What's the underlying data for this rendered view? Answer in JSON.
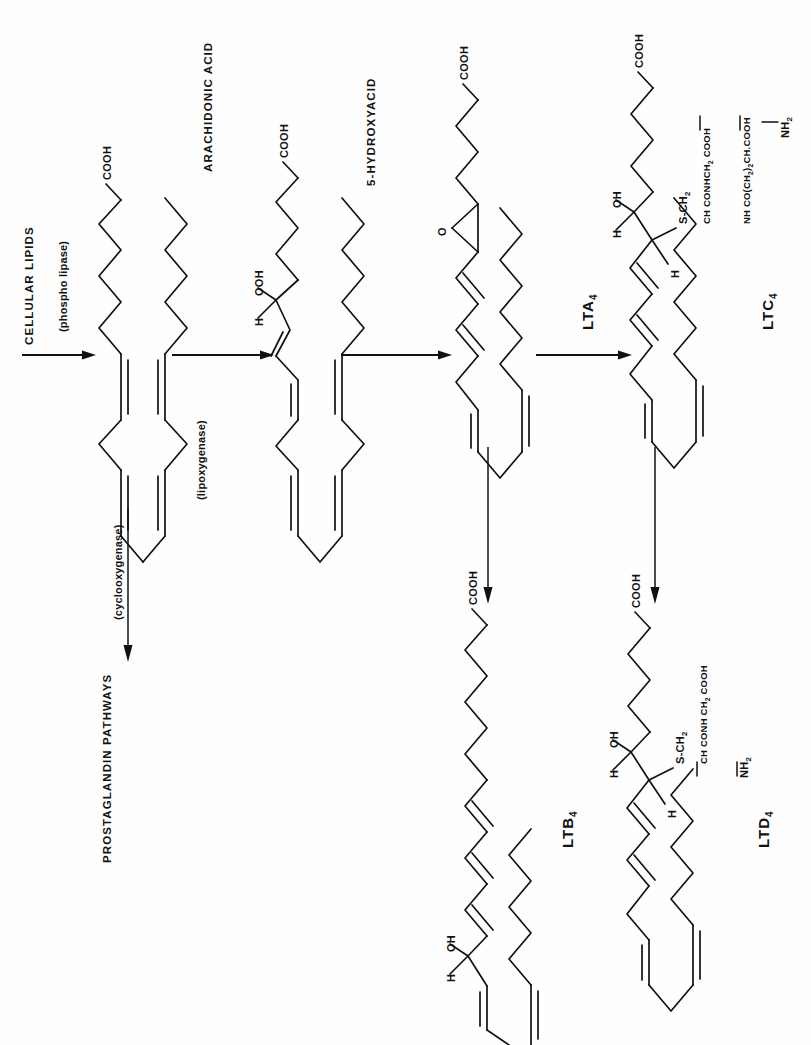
{
  "figure": {
    "orientation": "page rotated 90 degrees counter-clockwise; all text reads bottom-to-top",
    "background_color": "#fefefe",
    "ink_color": "#111111"
  },
  "labels": {
    "cellular_lipids": "CELLULAR LIPIDS",
    "phospholipase": "(phospho lipase)",
    "arachidonic_acid": "ARACHIDONIC ACID",
    "lipoxygenase": "(lipoxygenase)",
    "cyclooxygenase": "(cyclooxygenase)",
    "prostaglandin_pathways": "PROSTAGLANDIN PATHWAYS",
    "hydroxyacid": "5-HYDROXYACID",
    "lta4": "LTA",
    "lta4_sub": "4",
    "ltc4": "LTC",
    "ltc4_sub": "4",
    "ltb4": "LTB",
    "ltb4_sub": "4",
    "ltd4": "LTD",
    "ltd4_sub": "4"
  },
  "groups": {
    "cooh": "COOH",
    "ooh": "OOH",
    "h": "H",
    "oh": "OH",
    "o": "O",
    "nh2_text": "NH",
    "nh2_sub": "2",
    "s_ch2_text": "S-CH",
    "s_ch2_sub": "2",
    "ltc4_chain1_a": "CH CONHCH",
    "ltc4_chain1_sub": "2",
    "ltc4_chain1_b": " COOH",
    "ltc4_chain2_a": "NH CO(CH",
    "ltc4_chain2_sub1": "2",
    "ltc4_chain2_b": ")",
    "ltc4_chain2_sub2": "2",
    "ltc4_chain2_c": "CH.COOH",
    "ltd4_chain_a": "CH CONH CH",
    "ltd4_chain_sub": "2",
    "ltd4_chain_b": " COOH"
  },
  "structures": [
    {
      "name": "arachidonic-acid-structure",
      "position": "column-1",
      "terminal_group": "COOH",
      "double_bonds": 4
    },
    {
      "name": "hydroperoxy-acid-structure",
      "position": "column-2",
      "terminal_group": "COOH",
      "substituents": [
        "OOH",
        "H"
      ],
      "double_bonds": 4
    },
    {
      "name": "lta4-structure",
      "position": "column-3",
      "terminal_group": "COOH",
      "substituents": [
        "O epoxide"
      ],
      "double_bonds": 4
    },
    {
      "name": "ltc4-structure",
      "position": "column-4",
      "terminal_group": "COOH",
      "substituents": [
        "OH",
        "H",
        "S-CH2",
        "H"
      ],
      "double_bonds": 4
    },
    {
      "name": "ltb4-structure",
      "position": "row-2-column-3",
      "terminal_group": "COOH",
      "substituents": [
        "OH",
        "H"
      ],
      "double_bonds": 4
    },
    {
      "name": "ltd4-structure",
      "position": "row-2-column-4",
      "terminal_group": "COOH",
      "substituents": [
        "OH",
        "H",
        "S-CH2",
        "H"
      ],
      "double_bonds": 4
    }
  ],
  "arrows": [
    {
      "name": "arrow-lipids-to-arachidonic",
      "direction": "right"
    },
    {
      "name": "arrow-arachidonic-to-hydroperoxy",
      "direction": "right"
    },
    {
      "name": "arrow-hydroperoxy-to-lta4",
      "direction": "right"
    },
    {
      "name": "arrow-lta4-to-ltc4",
      "direction": "right"
    },
    {
      "name": "arrow-cyclooxygenase-to-prostaglandins",
      "direction": "down"
    },
    {
      "name": "arrow-lta4-to-ltb4",
      "direction": "down"
    },
    {
      "name": "arrow-ltc4-to-ltd4",
      "direction": "down"
    }
  ]
}
